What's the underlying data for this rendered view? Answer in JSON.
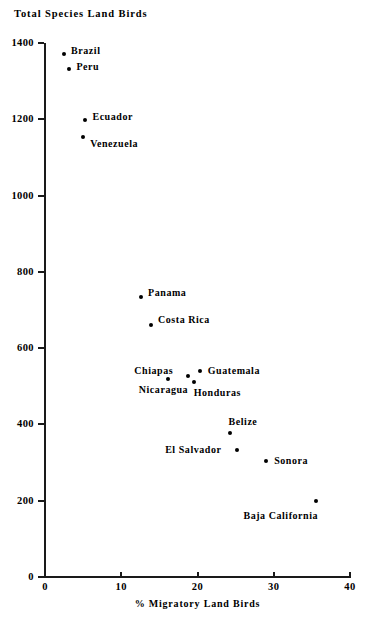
{
  "chart_data": {
    "type": "scatter",
    "title": "Total Species Land Birds",
    "xlabel": "% Migratory Land Birds",
    "ylabel": "Total Species Land Birds",
    "xlim": [
      0,
      40
    ],
    "ylim": [
      0,
      1400
    ],
    "xticks": [
      "0",
      "10",
      "20",
      "30",
      "40"
    ],
    "yticks": [
      "0",
      "200",
      "400",
      "600",
      "800",
      "1000",
      "1200",
      "1400"
    ],
    "grid": false,
    "legend": "none",
    "marker_color": "#000000",
    "axis_color": "#1a1a1a",
    "points": [
      {
        "label": "Brazil",
        "x": 2.5,
        "y": 1370,
        "label_dx": 7,
        "label_dy": -4
      },
      {
        "label": "Peru",
        "x": 3.2,
        "y": 1332,
        "label_dx": 7,
        "label_dy": -3
      },
      {
        "label": "Ecuador",
        "x": 5.3,
        "y": 1198,
        "label_dx": 7,
        "label_dy": -4
      },
      {
        "label": "Venezuela",
        "x": 5.0,
        "y": 1153,
        "label_dx": 7,
        "label_dy": 6
      },
      {
        "label": "Panama",
        "x": 12.6,
        "y": 735,
        "label_dx": 7,
        "label_dy": -5
      },
      {
        "label": "Costa Rica",
        "x": 13.9,
        "y": 660,
        "label_dx": 7,
        "label_dy": -6
      },
      {
        "label": "Guatemala",
        "x": 20.3,
        "y": 540,
        "label_dx": 8,
        "label_dy": -1
      },
      {
        "label": "Chiapas",
        "x": 18.8,
        "y": 528,
        "label_dx": -54,
        "label_dy": -6
      },
      {
        "label": "Honduras",
        "x": 19.5,
        "y": 512,
        "label_dx": 0,
        "label_dy": 10
      },
      {
        "label": "Nicaragua",
        "x": 16.1,
        "y": 518,
        "label_dx": -29,
        "label_dy": 10
      },
      {
        "label": "Belize",
        "x": 24.2,
        "y": 378,
        "label_dx": -1,
        "label_dy": -12
      },
      {
        "label": "El Salvador",
        "x": 25.2,
        "y": 332,
        "label_dx": -72,
        "label_dy": -1
      },
      {
        "label": "Sonora",
        "x": 29.0,
        "y": 305,
        "label_dx": 8,
        "label_dy": -1
      },
      {
        "label": "Baja California",
        "x": 35.6,
        "y": 200,
        "label_dx": -73,
        "label_dy": 14
      }
    ]
  }
}
